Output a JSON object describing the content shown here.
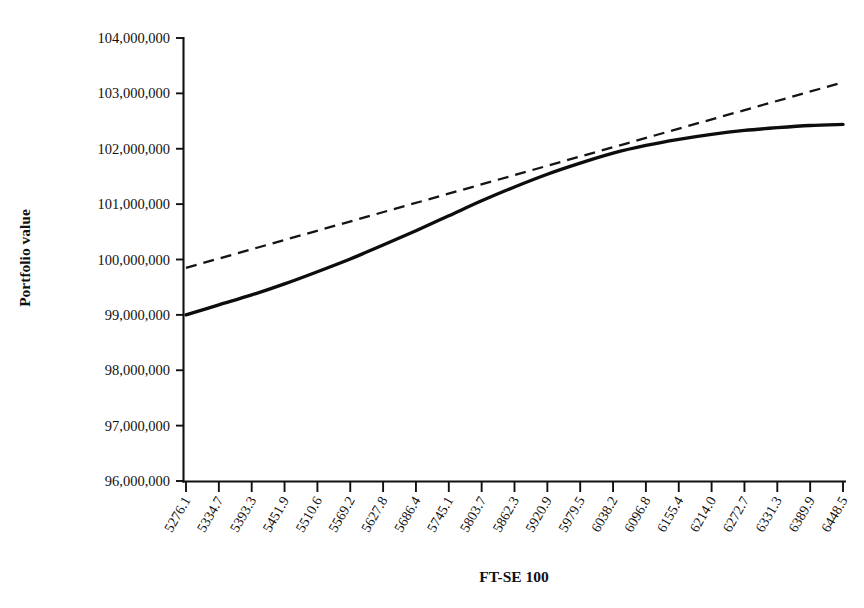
{
  "chart_data": {
    "type": "line",
    "title": "",
    "xlabel": "FT-SE 100",
    "ylabel": "Portfolio value",
    "xlim": [
      5276.1,
      6448.5
    ],
    "ylim": [
      96000000,
      104000000
    ],
    "grid": false,
    "legend": "none",
    "ytick_labels": [
      "104,000,000",
      "103,000,000",
      "102,000,000",
      "101,000,000",
      "100,000,000",
      "99,000,000",
      "98,000,000",
      "97,000,000",
      "96,000,000"
    ],
    "ytick_values": [
      104000000,
      103000000,
      102000000,
      101000000,
      100000000,
      99000000,
      98000000,
      97000000,
      96000000
    ],
    "categories": [
      "5276.1",
      "5334.7",
      "5393.3",
      "5451.9",
      "5510.6",
      "5569.2",
      "5627.8",
      "5686.4",
      "5745.1",
      "5803.7",
      "5862.3",
      "5920.9",
      "5979.5",
      "6038.2",
      "6096.8",
      "6155.4",
      "6214.0",
      "6272.7",
      "6331.3",
      "6389.9",
      "6448.5"
    ],
    "x": [
      5276.1,
      5334.7,
      5393.3,
      5451.9,
      5510.6,
      5569.2,
      5627.8,
      5686.4,
      5745.1,
      5803.7,
      5862.3,
      5920.9,
      5979.5,
      6038.2,
      6096.8,
      6155.4,
      6214.0,
      6272.7,
      6331.3,
      6389.9,
      6448.5
    ],
    "series": [
      {
        "name": "portfolio-value-curve",
        "style": "solid",
        "color": "#0d0d0d",
        "values": [
          99000000,
          99180000,
          99360000,
          99560000,
          99780000,
          100010000,
          100260000,
          100520000,
          100790000,
          101060000,
          101310000,
          101540000,
          101740000,
          101920000,
          102060000,
          102170000,
          102260000,
          102330000,
          102380000,
          102420000,
          102440000
        ]
      },
      {
        "name": "linear-approximation",
        "style": "dashed",
        "color": "#141414",
        "values": [
          99850000,
          99017000,
          100185000,
          100352000,
          100520000,
          100687000,
          100855000,
          101022000,
          101190000,
          101357000,
          101525000,
          101692000,
          101860000,
          102027000,
          102195000,
          102362000,
          102530000,
          102697000,
          102865000,
          103032000,
          103200000
        ],
        "start_value": 99850000,
        "end_value": 103200000
      }
    ]
  },
  "axes": {
    "y_title": "Portfolio value",
    "x_title": "FT-SE 100"
  }
}
